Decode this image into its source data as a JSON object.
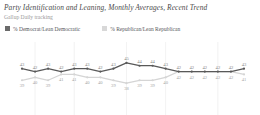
{
  "header": {
    "title": "Party Identification and Leaning, Monthly Averages, Recent Trend",
    "subtitle": "Gallup Daily tracking"
  },
  "legend": {
    "items": [
      {
        "label": "% Democrat/Lean Democratic",
        "color": "#6b6b6b",
        "swatch": "dark"
      },
      {
        "label": "% Republican/Lean Republican",
        "color": "#d8d8d8",
        "swatch": "light"
      }
    ]
  },
  "chart_data": {
    "type": "line",
    "title": "Party Identification and Leaning, Monthly Averages, Recent Trend",
    "subtitle": "Gallup Daily tracking",
    "xlabel": "",
    "ylabel": "",
    "ylim": [
      36,
      47
    ],
    "grid": "vertical-only",
    "legend_position": "top-left",
    "x": [
      1,
      2,
      3,
      4,
      5,
      6,
      7,
      8,
      9,
      10,
      11,
      12,
      13,
      14,
      15,
      16,
      17,
      18
    ],
    "series": [
      {
        "name": "% Democrat/Lean Democratic",
        "color": "#595959",
        "values": [
          43,
          42,
          43,
          42,
          43,
          43,
          42,
          43,
          45,
          44,
          44,
          43,
          42,
          42,
          42,
          42,
          42,
          43
        ]
      },
      {
        "name": "% Republican/Lean Republican",
        "color": "#d5d5d5",
        "values": [
          39,
          40,
          39,
          41,
          41,
          40,
          40,
          39,
          38,
          39,
          39,
          40,
          42,
          42,
          42,
          42,
          42,
          41
        ]
      }
    ],
    "gridline_positions": [
      1,
      4,
      8,
      11,
      15
    ]
  }
}
